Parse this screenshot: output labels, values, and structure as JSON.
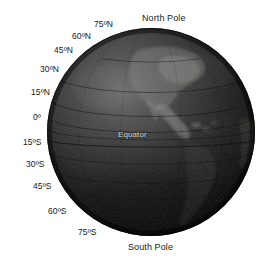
{
  "figure": {
    "kind": "globe-diagram",
    "background_color": "#ffffff",
    "globe_color_light": "#6d6d6d",
    "globe_color_dark": "#050505",
    "label_color": "#1a1a1a",
    "equator_label_color": "#d8d8d8"
  },
  "poles": {
    "north": "North Pole",
    "south": "South Pole"
  },
  "equator": {
    "label": "Equator"
  },
  "latitude_labels": [
    {
      "text": "75ºN",
      "value": 75,
      "hemisphere": "N",
      "x": 94,
      "y": 20
    },
    {
      "text": "60ºN",
      "value": 60,
      "hemisphere": "N",
      "x": 72,
      "y": 32
    },
    {
      "text": "45ºN",
      "value": 45,
      "hemisphere": "N",
      "x": 54,
      "y": 46
    },
    {
      "text": "30ºN",
      "value": 30,
      "hemisphere": "N",
      "x": 40,
      "y": 65
    },
    {
      "text": "15ºN",
      "value": 15,
      "hemisphere": "N",
      "x": 31,
      "y": 88
    },
    {
      "text": "0º",
      "value": 0,
      "hemisphere": "",
      "x": 33,
      "y": 113
    },
    {
      "text": "15ºS",
      "value": -15,
      "hemisphere": "S",
      "x": 23,
      "y": 138
    },
    {
      "text": "30ºS",
      "value": -30,
      "hemisphere": "S",
      "x": 26,
      "y": 160
    },
    {
      "text": "45ºS",
      "value": -45,
      "hemisphere": "S",
      "x": 33,
      "y": 182
    },
    {
      "text": "60ºS",
      "value": -60,
      "hemisphere": "S",
      "x": 48,
      "y": 207
    },
    {
      "text": "75ºS",
      "value": -75,
      "hemisphere": "S",
      "x": 78,
      "y": 228
    }
  ]
}
